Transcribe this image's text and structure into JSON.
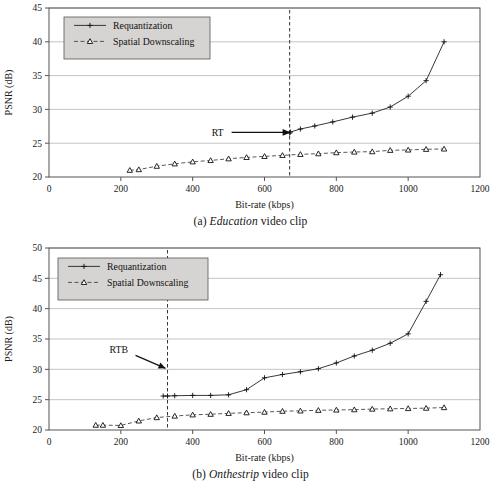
{
  "page": {
    "background": "#ffffff"
  },
  "figures": [
    {
      "id": "a",
      "caption_prefix": "(a)",
      "caption_italic": "Education",
      "caption_suffix": "video clip",
      "caption_full": "(a) Education video clip"
    },
    {
      "id": "b",
      "caption_prefix": "(b)",
      "caption_italic": "Onthestrip",
      "caption_suffix": "video clip",
      "caption_full": "(b) Onthestrip video clip"
    }
  ],
  "chart_data": [
    {
      "type": "line",
      "id": "education",
      "title": "(a) Education video clip",
      "xlabel": "Bit-rate (kbps)",
      "ylabel": "PSNR (dB)",
      "xlim": [
        0,
        1200
      ],
      "ylim": [
        20,
        45
      ],
      "xticks": [
        0,
        200,
        400,
        600,
        800,
        1000,
        1200
      ],
      "yticks": [
        20,
        25,
        30,
        35,
        40,
        45
      ],
      "grid": "horizontal",
      "legend_position": "top-left",
      "legend": [
        "Requantization",
        "Spatial Downscaling"
      ],
      "annotations": [
        {
          "text": "RT",
          "kind": "arrow-label",
          "points_to_x": 670,
          "points_to_y": 26.6
        }
      ],
      "reference_lines": [
        {
          "label": "RT",
          "orientation": "vertical",
          "x": 670,
          "style": "dashed"
        }
      ],
      "series": [
        {
          "name": "Requantization",
          "marker": "plus",
          "style": "solid",
          "x": [
            670,
            672,
            700,
            740,
            790,
            845,
            900,
            950,
            1000,
            1050,
            1100
          ],
          "y": [
            26.5,
            26.65,
            27.1,
            27.55,
            28.15,
            28.85,
            29.45,
            30.35,
            31.95,
            34.25,
            40.0
          ]
        },
        {
          "name": "Spatial Downscaling",
          "marker": "triangle",
          "style": "dashed",
          "x": [
            225,
            250,
            300,
            350,
            400,
            450,
            500,
            550,
            600,
            650,
            700,
            750,
            800,
            850,
            900,
            950,
            1000,
            1050,
            1100
          ],
          "y": [
            21.0,
            21.1,
            21.6,
            21.95,
            22.25,
            22.45,
            22.7,
            22.9,
            23.05,
            23.2,
            23.35,
            23.45,
            23.6,
            23.7,
            23.75,
            23.95,
            24.0,
            24.1,
            24.15
          ]
        }
      ]
    },
    {
      "type": "line",
      "id": "onthestrip",
      "title": "(b) Onthestrip video clip",
      "xlabel": "Bit-rate (kbps)",
      "ylabel": "PSNR (dB)",
      "xlim": [
        0,
        1200
      ],
      "ylim": [
        20,
        50
      ],
      "xticks": [
        0,
        200,
        400,
        600,
        800,
        1000,
        1200
      ],
      "yticks": [
        20,
        25,
        30,
        35,
        40,
        45,
        50
      ],
      "grid": "horizontal",
      "legend_position": "top-left",
      "legend": [
        "Requantization",
        "Spatial Downscaling"
      ],
      "annotations": [
        {
          "text": "RTB",
          "kind": "arrow-label",
          "points_to_x": 330,
          "points_to_y": 30.0
        }
      ],
      "reference_lines": [
        {
          "label": "RTB",
          "orientation": "vertical",
          "x": 330,
          "style": "dashed"
        }
      ],
      "series": [
        {
          "name": "Requantization",
          "marker": "plus",
          "style": "solid",
          "x": [
            318,
            330,
            350,
            400,
            450,
            500,
            550,
            600,
            650,
            700,
            750,
            800,
            850,
            900,
            950,
            1000,
            1050,
            1090
          ],
          "y": [
            25.6,
            25.6,
            25.65,
            25.7,
            25.7,
            25.8,
            26.65,
            28.6,
            29.15,
            29.6,
            30.1,
            31.05,
            32.2,
            33.15,
            34.3,
            35.85,
            41.2,
            45.6
          ]
        },
        {
          "name": "Spatial Downscaling",
          "marker": "triangle",
          "style": "dashed",
          "x": [
            130,
            150,
            200,
            250,
            300,
            350,
            400,
            450,
            500,
            550,
            600,
            650,
            700,
            750,
            800,
            850,
            900,
            950,
            1000,
            1050,
            1100
          ],
          "y": [
            20.8,
            20.8,
            20.75,
            21.5,
            22.05,
            22.3,
            22.5,
            22.6,
            22.75,
            22.85,
            22.95,
            23.1,
            23.15,
            23.25,
            23.3,
            23.35,
            23.45,
            23.5,
            23.55,
            23.6,
            23.7
          ]
        }
      ]
    }
  ],
  "colors": {
    "line_primary": "#222222",
    "line_secondary": "#444444",
    "grid": "#aaaaaa",
    "axis": "#555555",
    "legend_background": "#d6d4d2",
    "text": "#1a1a1a"
  }
}
